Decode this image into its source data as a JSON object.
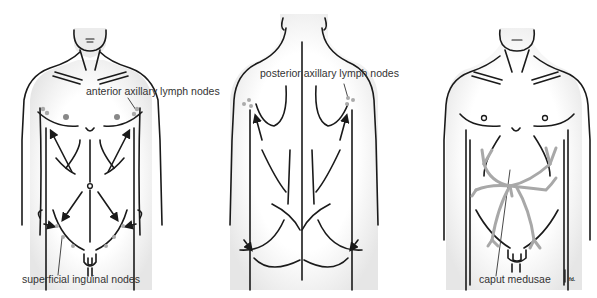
{
  "figure": {
    "panels": [
      {
        "id": "anterior",
        "view": "anterior torso",
        "labels": [
          {
            "text": "anterior axillary lymph nodes"
          },
          {
            "text": "superficial inguinal nodes"
          }
        ]
      },
      {
        "id": "posterior",
        "view": "posterior torso",
        "labels": [
          {
            "text": "posterior axillary lymph nodes"
          }
        ]
      },
      {
        "id": "caput",
        "view": "anterior torso with dilated veins",
        "labels": [
          {
            "text": "caput medusae"
          }
        ]
      }
    ],
    "signature": "fd.",
    "colors": {
      "outline": "#1a1a1a",
      "skin_shade": "#e9e9e9",
      "node_dot": "#aaaaaa",
      "vein": "#a8a8a8",
      "label_text": "#333333"
    }
  }
}
